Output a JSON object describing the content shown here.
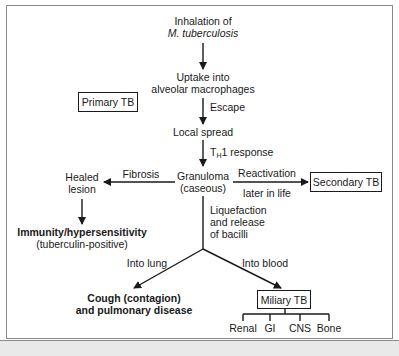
{
  "diagram": {
    "nodes": {
      "inhalation": {
        "line1": "Inhalation of",
        "line2": "M. tuberculosis"
      },
      "uptake": {
        "line1": "Uptake into",
        "line2": "alveolar macrophages"
      },
      "primary_tb": "Primary TB",
      "local_spread": "Local spread",
      "granuloma": {
        "line1": "Granuloma",
        "line2": "(caseous)"
      },
      "healed_lesion": {
        "line1": "Healed",
        "line2": "lesion"
      },
      "immunity": {
        "line1": "Immunity/hypersensitivity",
        "line2": "(tuberculin-positive)"
      },
      "secondary_tb": "Secondary TB",
      "cough": {
        "line1": "Cough (contagion)",
        "line2": "and pulmonary disease"
      },
      "miliary_tb": "Miliary TB",
      "sites": [
        "Renal",
        "GI",
        "CNS",
        "Bone"
      ]
    },
    "edges": {
      "escape": "Escape",
      "th1": {
        "prefix": "T",
        "sub": "H",
        "suffix": "1 response"
      },
      "fibrosis": "Fibrosis",
      "reactivation": {
        "line1": "Reactivation",
        "line2": "later in life"
      },
      "liquefaction": {
        "line1": "Liquefaction",
        "line2": "and release",
        "line3": "of bacilli"
      },
      "into_lung": "Into lung",
      "into_blood": "Into blood"
    },
    "colors": {
      "ink": "#1a1a1a",
      "frame": "#8a8a8a",
      "strip": "#e9e9e9"
    }
  }
}
